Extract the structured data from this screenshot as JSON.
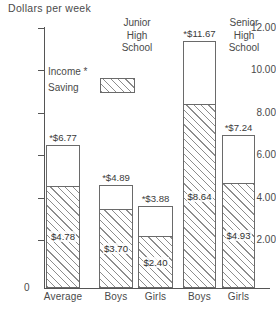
{
  "chart_data": {
    "type": "bar",
    "title": "Dollars per week",
    "subtitle": "",
    "xlabel": "",
    "ylabel": "Dollars per week",
    "ylim": [
      0,
      12
    ],
    "ytick_labels": [
      "12.00",
      "10.00",
      "8.00",
      "6.00",
      "4.00",
      "2.00",
      "0"
    ],
    "ytick_values": [
      12,
      10,
      8,
      6,
      4,
      2,
      0
    ],
    "grid": false,
    "stacked": true,
    "legend_position": "upper-left-inside",
    "legend": [
      {
        "label": "Income *",
        "pattern": "none"
      },
      {
        "label": "Saving",
        "pattern": "diagonal-hatch"
      }
    ],
    "categories": [
      "Average",
      "Boys",
      "Girls",
      "Boys",
      "Girls"
    ],
    "series": [
      {
        "name": "Income *",
        "values": [
          6.77,
          4.89,
          3.88,
          11.67,
          7.24
        ]
      },
      {
        "name": "Saving",
        "values": [
          4.78,
          3.7,
          2.4,
          8.64,
          4.93
        ]
      }
    ],
    "income_labels": [
      "*$6.77",
      "*$4.89",
      "*$3.88",
      "*$11.67",
      "*$7.24"
    ],
    "saving_labels": [
      "$4.78",
      "$3.70",
      "$2.40",
      "$8.64",
      "$4.93"
    ],
    "group_notes": [
      {
        "lines": [
          "Junior",
          "High",
          "School"
        ]
      },
      {
        "lines": [
          "Senior",
          "High",
          "School"
        ]
      }
    ]
  },
  "axis_title": "Dollars per week",
  "zero_label": "0",
  "bars": [
    {
      "category": "Average",
      "total_label": "*$6.77",
      "saving_label": "$4.78",
      "total": 6.77,
      "saving": 4.78
    },
    {
      "category": "Boys",
      "total_label": "*$4.89",
      "saving_label": "$3.70",
      "total": 4.89,
      "saving": 3.7
    },
    {
      "category": "Girls",
      "total_label": "*$3.88",
      "saving_label": "$2.40",
      "total": 3.88,
      "saving": 2.4
    },
    {
      "category": "Boys",
      "total_label": "*$11.67",
      "saving_label": "$8.64",
      "total": 11.67,
      "saving": 8.64
    },
    {
      "category": "Girls",
      "total_label": "*$7.24",
      "saving_label": "$4.93",
      "total": 7.24,
      "saving": 4.93
    }
  ],
  "yticks": [
    "12.00",
    "10.00",
    "8.00",
    "6.00",
    "4.00",
    "2.00"
  ],
  "legend": {
    "income": "Income *",
    "saving": "Saving"
  },
  "notes": {
    "junior": {
      "l1": "Junior",
      "l2": "High",
      "l3": "School"
    },
    "senior": {
      "l1": "Senior",
      "l2": "High",
      "l3": "School"
    }
  },
  "colors": {
    "ink": "#4a4a4a",
    "rule": "#6a6a6a",
    "hatch": "#8d8d8d",
    "background": "#ffffff"
  }
}
